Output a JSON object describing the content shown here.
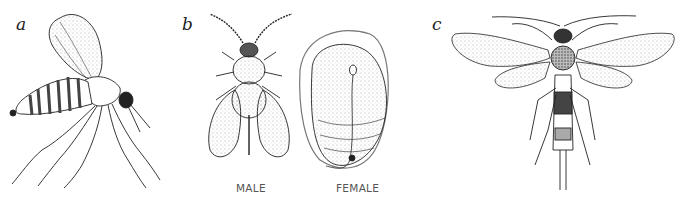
{
  "figure": {
    "panels": [
      {
        "label": "a",
        "subject": "fly (gnat) side view"
      },
      {
        "label": "b",
        "subject": "scale insect male and female",
        "captions": [
          "MALE",
          "FEMALE"
        ]
      },
      {
        "label": "c",
        "subject": "wood wasp / horntail dorsal view"
      }
    ]
  },
  "colors": {
    "ink": "#222222",
    "paper": "#ffffff",
    "caption": "#555555"
  }
}
